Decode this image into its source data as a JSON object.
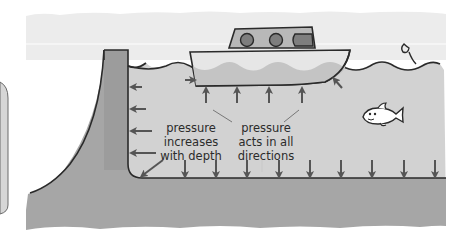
{
  "diagram": {
    "labels": {
      "depth": [
        "pressure",
        "increases",
        "with depth"
      ],
      "directions": [
        "pressure",
        "acts in all",
        "directions"
      ]
    },
    "elements": {
      "boat": "boat-floating-on-water",
      "fish": "fish",
      "wall": "container-wall",
      "floor": "container-floor",
      "water": "water"
    },
    "arrows": {
      "wall_left_arrows": 4,
      "corner_diagonal_arrow": 1,
      "floor_down_arrows": 9,
      "boat_up_arrows": 4,
      "boat_side_arrows": 2
    },
    "colors": {
      "sky": "#ececec",
      "water": "#d2d2d2",
      "ground": "#a6a6a6",
      "wall": "#9c9c9c",
      "boat_hull": "#e6e6e6",
      "boat_cabin": "#b8b8b8",
      "window": "#7e7e7e",
      "arrow": "#555555",
      "outline": "#2a2a2a"
    }
  }
}
